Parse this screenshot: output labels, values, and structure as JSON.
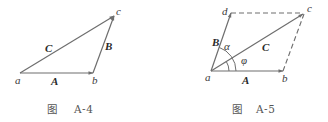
{
  "figures": [
    {
      "id": "A-4",
      "caption_prefix": "图",
      "caption_number": "A-4",
      "points": {
        "a": {
          "label": "a",
          "x": 20,
          "y": 73
        },
        "b": {
          "label": "b",
          "x": 93,
          "y": 73
        },
        "c": {
          "label": "c",
          "x": 114,
          "y": 16
        }
      },
      "vectors": [
        {
          "name": "A",
          "label": "A",
          "from": "a",
          "to": "b"
        },
        {
          "name": "B",
          "label": "B",
          "from": "b",
          "to": "c"
        },
        {
          "name": "C",
          "label": "C",
          "from": "a",
          "to": "c"
        }
      ]
    },
    {
      "id": "A-5",
      "caption_prefix": "图",
      "caption_number": "A-5",
      "points": {
        "a": {
          "label": "a",
          "x": 211,
          "y": 71
        },
        "b": {
          "label": "b",
          "x": 283,
          "y": 71
        },
        "c": {
          "label": "c",
          "x": 304,
          "y": 13
        },
        "d": {
          "label": "d",
          "x": 231,
          "y": 13
        }
      },
      "vectors": [
        {
          "name": "A",
          "label": "A",
          "from": "a",
          "to": "b"
        },
        {
          "name": "B",
          "label": "B",
          "from": "a",
          "to": "d"
        },
        {
          "name": "C",
          "label": "C",
          "from": "a",
          "to": "c"
        }
      ],
      "dashed_edges": [
        {
          "from": "d",
          "to": "c"
        },
        {
          "from": "b",
          "to": "c"
        }
      ],
      "angles": [
        {
          "symbol": "α",
          "between": [
            "A",
            "B"
          ]
        },
        {
          "symbol": "φ",
          "between": [
            "A",
            "C"
          ]
        }
      ]
    }
  ],
  "colors": {
    "line": "#6e6e6e",
    "text": "#3a3a3a",
    "caption": "#555555"
  }
}
